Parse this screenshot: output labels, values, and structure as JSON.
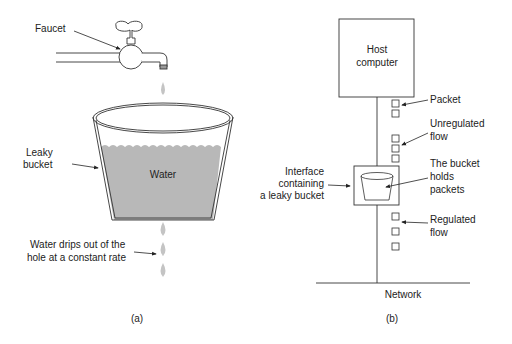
{
  "panel_a": {
    "faucet_label": "Faucet",
    "bucket_label_line1": "Leaky",
    "bucket_label_line2": "bucket",
    "water_label": "Water",
    "drips_label_line1": "Water drips out of the",
    "drips_label_line2": "hole at a constant rate",
    "caption": "(a)"
  },
  "panel_b": {
    "host_line1": "Host",
    "host_line2": "computer",
    "packet_label": "Packet",
    "unregulated_line1": "Unregulated",
    "unregulated_line2": "flow",
    "bucket_holds_line1": "The bucket",
    "bucket_holds_line2": "holds",
    "bucket_holds_line3": "packets",
    "interface_line1": "Interface",
    "interface_line2": "containing",
    "interface_line3": "a leaky bucket",
    "regulated_line1": "Regulated",
    "regulated_line2": "flow",
    "network_label": "Network",
    "caption": "(b)"
  },
  "colors": {
    "water": "#b8b8b8",
    "drop": "#c4c4c4",
    "stroke": "#333333"
  }
}
